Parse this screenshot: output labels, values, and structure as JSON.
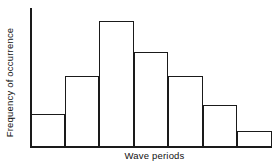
{
  "chart_data": {
    "type": "bar",
    "title": "",
    "subtitle": "",
    "xlabel": "Wave periods",
    "ylabel": "Frequency of occurrence",
    "categories": [
      "1",
      "2",
      "3",
      "4",
      "5",
      "6",
      "7"
    ],
    "values": [
      24,
      53,
      95,
      71,
      53,
      31,
      11
    ],
    "series": [
      {
        "name": "Frequency of occurrence",
        "values": [
          24,
          53,
          95,
          71,
          53,
          31,
          11
        ]
      }
    ],
    "ylim": [
      0,
      100
    ],
    "xlim": [
      0,
      7
    ],
    "grid": false,
    "legend": false,
    "legend_position": "none",
    "tick_labels_x": [],
    "tick_labels_y": [],
    "annotations": [],
    "bar_style": {
      "fill": "none",
      "stroke": "#1a1a1a",
      "stroke_width": 1.6,
      "gap": 0
    },
    "axis_color": "#1a1a1a",
    "background": "#ffffff"
  },
  "figure": {
    "xlabel": "Wave periods",
    "ylabel": "Frequency of occurrence"
  }
}
